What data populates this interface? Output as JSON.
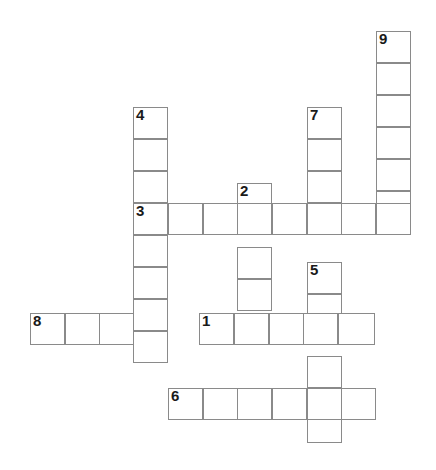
{
  "puzzle": {
    "title": "Crossword puzzle grid",
    "type": "crossword-grid",
    "background_color": "#ffffff",
    "cell_border_color": "#8a8a8a",
    "number_color": "#1a1a1a",
    "cell_width": 34.6,
    "cell_height": 32,
    "canvas": {
      "width": 436,
      "height": 470
    },
    "entries": [
      {
        "number": "1",
        "direction": "across",
        "length": 5,
        "start": {
          "x": 199,
          "y": 313
        }
      },
      {
        "number": "2",
        "direction": "down",
        "length": 5,
        "start": {
          "x": 237,
          "y": 183
        }
      },
      {
        "number": "3",
        "direction": "across",
        "length": 8,
        "start": {
          "x": 133,
          "y": 203
        }
      },
      {
        "number": "4",
        "direction": "down",
        "length": 8,
        "start": {
          "x": 133,
          "y": 107
        }
      },
      {
        "number": "5",
        "direction": "down",
        "length": 6,
        "start": {
          "x": 307,
          "y": 262
        }
      },
      {
        "number": "6",
        "direction": "across",
        "length": 6,
        "start": {
          "x": 168,
          "y": 388
        }
      },
      {
        "number": "7",
        "direction": "down",
        "length": 4,
        "start": {
          "x": 307,
          "y": 107
        }
      },
      {
        "number": "8",
        "direction": "across",
        "length": 4,
        "start": {
          "x": 30,
          "y": 313
        }
      },
      {
        "number": "9",
        "direction": "down",
        "length": 6,
        "start": {
          "x": 376,
          "y": 31
        }
      }
    ],
    "cells": [
      {
        "name": "cell-c9-r0",
        "x": 376,
        "y": 31,
        "w": 35,
        "h": 32,
        "number": "9"
      },
      {
        "name": "cell-c9-r1",
        "x": 376,
        "y": 63,
        "w": 35,
        "h": 32,
        "number": ""
      },
      {
        "name": "cell-c9-r2",
        "x": 376,
        "y": 95,
        "w": 35,
        "h": 32,
        "number": ""
      },
      {
        "name": "cell-c9-r3",
        "x": 376,
        "y": 127,
        "w": 35,
        "h": 32,
        "number": ""
      },
      {
        "name": "cell-c9-r4",
        "x": 376,
        "y": 159,
        "w": 35,
        "h": 32,
        "number": ""
      },
      {
        "name": "cell-c9-r5",
        "x": 376,
        "y": 191,
        "w": 35,
        "h": 32,
        "number": ""
      },
      {
        "name": "cell-c4-r0",
        "x": 133,
        "y": 107,
        "w": 35,
        "h": 32,
        "number": "4"
      },
      {
        "name": "cell-c4-r1",
        "x": 133,
        "y": 139,
        "w": 35,
        "h": 32,
        "number": ""
      },
      {
        "name": "cell-c4-r2",
        "x": 133,
        "y": 171,
        "w": 35,
        "h": 32,
        "number": ""
      },
      {
        "name": "cell-c4-r4",
        "x": 133,
        "y": 235,
        "w": 35,
        "h": 32,
        "number": ""
      },
      {
        "name": "cell-c4-r5",
        "x": 133,
        "y": 267,
        "w": 35,
        "h": 32,
        "number": ""
      },
      {
        "name": "cell-c4-r6",
        "x": 133,
        "y": 299,
        "w": 35,
        "h": 32,
        "number": ""
      },
      {
        "name": "cell-c4-r7",
        "x": 133,
        "y": 331,
        "w": 35,
        "h": 32,
        "number": ""
      },
      {
        "name": "cell-c7-r0",
        "x": 307,
        "y": 107,
        "w": 35,
        "h": 32,
        "number": "7"
      },
      {
        "name": "cell-c7-r1",
        "x": 307,
        "y": 139,
        "w": 35,
        "h": 32,
        "number": ""
      },
      {
        "name": "cell-c7-r2",
        "x": 307,
        "y": 171,
        "w": 35,
        "h": 32,
        "number": ""
      },
      {
        "name": "cell-c2-r0",
        "x": 237,
        "y": 183,
        "w": 35,
        "h": 32,
        "number": "2"
      },
      {
        "name": "cell-c2-r2",
        "x": 237,
        "y": 247,
        "w": 35,
        "h": 32,
        "number": ""
      },
      {
        "name": "cell-c2-r3",
        "x": 237,
        "y": 279,
        "w": 35,
        "h": 32,
        "number": ""
      },
      {
        "name": "cell-row3-c0",
        "x": 133,
        "y": 203,
        "w": 35,
        "h": 32,
        "number": "3"
      },
      {
        "name": "cell-row3-c1",
        "x": 168,
        "y": 203,
        "w": 35,
        "h": 32,
        "number": ""
      },
      {
        "name": "cell-row3-c2",
        "x": 203,
        "y": 203,
        "w": 35,
        "h": 32,
        "number": ""
      },
      {
        "name": "cell-row3-c3",
        "x": 237,
        "y": 203,
        "w": 35,
        "h": 32,
        "number": ""
      },
      {
        "name": "cell-row3-c4",
        "x": 272,
        "y": 203,
        "w": 35,
        "h": 32,
        "number": ""
      },
      {
        "name": "cell-row3-c5",
        "x": 307,
        "y": 203,
        "w": 35,
        "h": 32,
        "number": ""
      },
      {
        "name": "cell-row3-c6",
        "x": 341,
        "y": 203,
        "w": 35,
        "h": 32,
        "number": ""
      },
      {
        "name": "cell-row3-c7",
        "x": 376,
        "y": 203,
        "w": 35,
        "h": 32,
        "number": ""
      },
      {
        "name": "cell-c5-r0",
        "x": 307,
        "y": 262,
        "w": 35,
        "h": 32,
        "number": "5"
      },
      {
        "name": "cell-c5-r1",
        "x": 307,
        "y": 294,
        "w": 35,
        "h": 32,
        "number": ""
      },
      {
        "name": "cell-c5-r3",
        "x": 307,
        "y": 356,
        "w": 35,
        "h": 32,
        "number": ""
      },
      {
        "name": "cell-c5-r5",
        "x": 307,
        "y": 411,
        "w": 35,
        "h": 32,
        "number": ""
      },
      {
        "name": "cell-row8-c0",
        "x": 30,
        "y": 313,
        "w": 35,
        "h": 32,
        "number": "8"
      },
      {
        "name": "cell-row8-c1",
        "x": 65,
        "y": 313,
        "w": 35,
        "h": 32,
        "number": ""
      },
      {
        "name": "cell-row8-c2",
        "x": 99,
        "y": 313,
        "w": 35,
        "h": 32,
        "number": ""
      },
      {
        "name": "cell-row1-c0",
        "x": 199,
        "y": 313,
        "w": 35,
        "h": 32,
        "number": "1"
      },
      {
        "name": "cell-row1-c1",
        "x": 234,
        "y": 313,
        "w": 35,
        "h": 32,
        "number": ""
      },
      {
        "name": "cell-row1-c2",
        "x": 269,
        "y": 313,
        "w": 35,
        "h": 32,
        "number": ""
      },
      {
        "name": "cell-row1-c3",
        "x": 303,
        "y": 313,
        "w": 35,
        "h": 32,
        "number": ""
      },
      {
        "name": "cell-row1-c4",
        "x": 338,
        "y": 313,
        "w": 37,
        "h": 32,
        "number": ""
      },
      {
        "name": "cell-row6-c0",
        "x": 168,
        "y": 388,
        "w": 35,
        "h": 32,
        "number": "6"
      },
      {
        "name": "cell-row6-c1",
        "x": 203,
        "y": 388,
        "w": 35,
        "h": 32,
        "number": ""
      },
      {
        "name": "cell-row6-c2",
        "x": 237,
        "y": 388,
        "w": 35,
        "h": 32,
        "number": ""
      },
      {
        "name": "cell-row6-c3",
        "x": 272,
        "y": 388,
        "w": 35,
        "h": 32,
        "number": ""
      },
      {
        "name": "cell-row6-c4",
        "x": 307,
        "y": 388,
        "w": 35,
        "h": 32,
        "number": ""
      },
      {
        "name": "cell-row6-c5",
        "x": 341,
        "y": 388,
        "w": 35,
        "h": 32,
        "number": ""
      }
    ]
  }
}
